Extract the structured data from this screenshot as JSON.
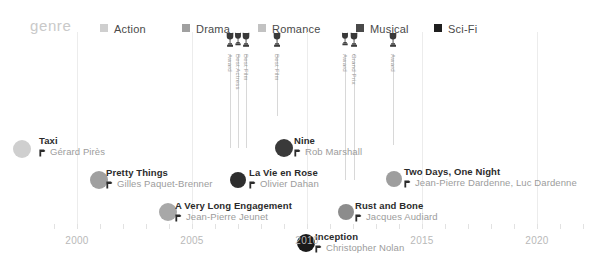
{
  "legend": {
    "title": "genre",
    "items": [
      {
        "label": "Action",
        "color": "#cfcfcf",
        "x": 100
      },
      {
        "label": "Drama",
        "color": "#a0a0a0",
        "x": 182
      },
      {
        "label": "Romance",
        "color": "#c2c2c2",
        "x": 258
      },
      {
        "label": "Musical",
        "color": "#4a4a4a",
        "x": 356
      },
      {
        "label": "Sci-Fi",
        "color": "#1f1f1f",
        "x": 434
      }
    ]
  },
  "axis": {
    "years": [
      {
        "label": "2000",
        "x": 77
      },
      {
        "label": "2005",
        "x": 192
      },
      {
        "label": "2010",
        "x": 307
      },
      {
        "label": "2015",
        "x": 422
      },
      {
        "label": "2020",
        "x": 537
      }
    ],
    "tick_start": 54,
    "tick_step": 23,
    "tick_count": 24,
    "year_label_y": 203,
    "tick_y": 196
  },
  "gridlines": [
    77,
    192,
    307,
    422,
    537
  ],
  "awards": [
    {
      "name": "award-trophy-1",
      "x": 230,
      "label": "Award",
      "size": 1.0,
      "stem_to": 116
    },
    {
      "name": "award-trophy-2",
      "x": 238,
      "label": "Best Actress",
      "size": 0.9,
      "stem_to": 116
    },
    {
      "name": "award-trophy-3",
      "x": 246,
      "label": "Best Film",
      "size": 1.0,
      "stem_to": 116
    },
    {
      "name": "award-trophy-4",
      "x": 277,
      "label": "Best Film",
      "size": 1.0,
      "stem_to": 84
    },
    {
      "name": "award-trophy-5",
      "x": 345,
      "label": "Award",
      "size": 0.9,
      "stem_to": 148
    },
    {
      "name": "award-trophy-6",
      "x": 354,
      "label": "Grand Prix",
      "size": 1.0,
      "stem_to": 148
    },
    {
      "name": "award-trophy-7",
      "x": 393,
      "label": "Award",
      "size": 1.0,
      "stem_to": 113
    }
  ],
  "films": [
    {
      "title": "Taxi",
      "director": "Gérard Pirès",
      "genre": "Action",
      "color": "#cfcfcf",
      "cx": 22,
      "cy": 117,
      "r": 9,
      "tx": 39,
      "ty": 103
    },
    {
      "title": "Pretty Things",
      "director": "Gilles Paquet-Brenner",
      "genre": "Drama",
      "color": "#a0a0a0",
      "cx": 99,
      "cy": 148,
      "r": 9,
      "tx": 106,
      "ty": 135
    },
    {
      "title": "A Very Long Engagement",
      "director": "Jean-Pierre Jeunet",
      "genre": "Romance",
      "color": "#a8a8a8",
      "cx": 168,
      "cy": 180,
      "r": 9,
      "tx": 175,
      "ty": 168
    },
    {
      "title": "La Vie en Rose",
      "director": "Olivier Dahan",
      "genre": "Musical",
      "color": "#2e2e2e",
      "cx": 238,
      "cy": 148,
      "r": 8,
      "tx": 249,
      "ty": 135
    },
    {
      "title": "Nine",
      "director": "Rob Marshall",
      "genre": "Musical",
      "color": "#3a3a3a",
      "cx": 284,
      "cy": 116,
      "r": 9,
      "tx": 294,
      "ty": 103
    },
    {
      "title": "Inception",
      "director": "Christopher Nolan",
      "genre": "Sci-Fi",
      "color": "#1a1a1a",
      "cx": 306,
      "cy": 211,
      "r": 9,
      "tx": 315,
      "ty": 199
    },
    {
      "title": "Rust and Bone",
      "director": "Jacques Audiard",
      "genre": "Romance",
      "color": "#8c8c8c",
      "cx": 346,
      "cy": 180,
      "r": 8,
      "tx": 355,
      "ty": 168
    },
    {
      "title": "Two Days, One Night",
      "director": "Jean-Pierre Dardenne, Luc Dardenne",
      "genre": "Drama",
      "color": "#9e9e9e",
      "cx": 394,
      "cy": 147,
      "r": 8,
      "tx": 404,
      "ty": 134
    }
  ],
  "chart_data": {
    "type": "scatter",
    "title": "genre",
    "xlabel": "",
    "ylabel": "",
    "xlim": [
      1998,
      2021
    ],
    "tick_labels": [
      "2000",
      "2005",
      "2010",
      "2015",
      "2020"
    ],
    "grid": true,
    "legend_position": "top",
    "legend_entries": [
      "Action",
      "Drama",
      "Romance",
      "Musical",
      "Sci-Fi"
    ],
    "points": [
      {
        "x": 1998,
        "label": "Taxi",
        "director": "Gérard Pirès",
        "genre": "Action"
      },
      {
        "x": 2001,
        "label": "Pretty Things",
        "director": "Gilles Paquet-Brenner",
        "genre": "Drama"
      },
      {
        "x": 2004,
        "label": "A Very Long Engagement",
        "director": "Jean-Pierre Jeunet",
        "genre": "Romance"
      },
      {
        "x": 2007,
        "label": "La Vie en Rose",
        "director": "Olivier Dahan",
        "genre": "Musical"
      },
      {
        "x": 2009,
        "label": "Nine",
        "director": "Rob Marshall",
        "genre": "Musical"
      },
      {
        "x": 2010,
        "label": "Inception",
        "director": "Christopher Nolan",
        "genre": "Sci-Fi"
      },
      {
        "x": 2012,
        "label": "Rust and Bone",
        "director": "Jacques Audiard",
        "genre": "Romance"
      },
      {
        "x": 2014,
        "label": "Two Days, One Night",
        "director": "Jean-Pierre Dardenne, Luc Dardenne",
        "genre": "Drama"
      }
    ],
    "annotations": [
      "Award",
      "Best Actress",
      "Best Film",
      "Best Film",
      "Award",
      "Grand Prix",
      "Award"
    ]
  }
}
